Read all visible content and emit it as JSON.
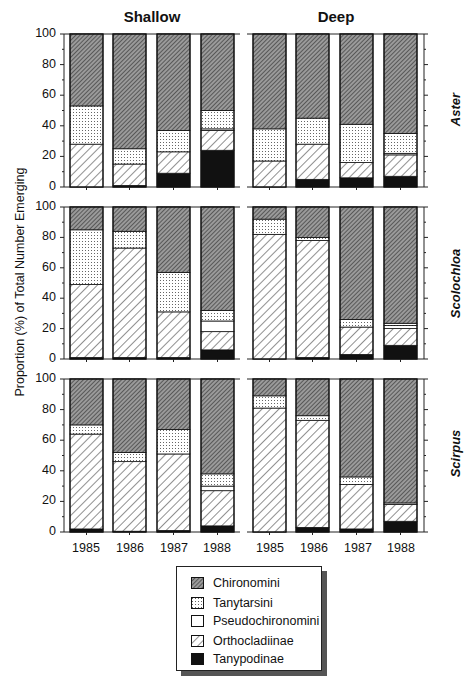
{
  "chart_data": {
    "type": "bar",
    "stacked": true,
    "ylabel": "Proportion (%) of Total Number Emerging",
    "ylim": [
      0,
      100
    ],
    "yticks": [
      0,
      20,
      40,
      60,
      80,
      100
    ],
    "categories": [
      "1985",
      "1986",
      "1987",
      "1988"
    ],
    "columns": [
      "Shallow",
      "Deep"
    ],
    "rows": [
      "Aster",
      "Scolochloa",
      "Scirpus"
    ],
    "series_order_bottom_to_top": [
      "Tanypodinae",
      "Orthocladiinae",
      "Pseudochironomini",
      "Tanytarsini",
      "Chironomini"
    ],
    "legend": [
      "Chironomini",
      "Tanytarsini",
      "Pseudochironomini",
      "Orthocladiinae",
      "Tanypodinae"
    ],
    "panels": [
      {
        "row": "Aster",
        "column": "Shallow",
        "bars": [
          {
            "year": "1985",
            "Tanypodinae": 0,
            "Orthocladiinae": 28,
            "Pseudochironomini": 0,
            "Tanytarsini": 25,
            "Chironomini": 47
          },
          {
            "year": "1986",
            "Tanypodinae": 1,
            "Orthocladiinae": 14,
            "Pseudochironomini": 0,
            "Tanytarsini": 10,
            "Chironomini": 75
          },
          {
            "year": "1987",
            "Tanypodinae": 9,
            "Orthocladiinae": 14,
            "Pseudochironomini": 0,
            "Tanytarsini": 14,
            "Chironomini": 63
          },
          {
            "year": "1988",
            "Tanypodinae": 24,
            "Orthocladiinae": 13,
            "Pseudochironomini": 1,
            "Tanytarsini": 12,
            "Chironomini": 50
          }
        ]
      },
      {
        "row": "Aster",
        "column": "Deep",
        "bars": [
          {
            "year": "1985",
            "Tanypodinae": 0,
            "Orthocladiinae": 17,
            "Pseudochironomini": 0,
            "Tanytarsini": 21,
            "Chironomini": 62
          },
          {
            "year": "1986",
            "Tanypodinae": 5,
            "Orthocladiinae": 23,
            "Pseudochironomini": 0,
            "Tanytarsini": 17,
            "Chironomini": 55
          },
          {
            "year": "1987",
            "Tanypodinae": 6,
            "Orthocladiinae": 10,
            "Pseudochironomini": 0,
            "Tanytarsini": 25,
            "Chironomini": 59
          },
          {
            "year": "1988",
            "Tanypodinae": 7,
            "Orthocladiinae": 14,
            "Pseudochironomini": 1,
            "Tanytarsini": 13,
            "Chironomini": 65
          }
        ]
      },
      {
        "row": "Scolochloa",
        "column": "Shallow",
        "bars": [
          {
            "year": "1985",
            "Tanypodinae": 1,
            "Orthocladiinae": 48,
            "Pseudochironomini": 0,
            "Tanytarsini": 36,
            "Chironomini": 15
          },
          {
            "year": "1986",
            "Tanypodinae": 1,
            "Orthocladiinae": 72,
            "Pseudochironomini": 0,
            "Tanytarsini": 11,
            "Chironomini": 16
          },
          {
            "year": "1987",
            "Tanypodinae": 1,
            "Orthocladiinae": 30,
            "Pseudochironomini": 0,
            "Tanytarsini": 26,
            "Chironomini": 43
          },
          {
            "year": "1988",
            "Tanypodinae": 6,
            "Orthocladiinae": 12,
            "Pseudochironomini": 7,
            "Tanytarsini": 7,
            "Chironomini": 68
          }
        ]
      },
      {
        "row": "Scolochloa",
        "column": "Deep",
        "bars": [
          {
            "year": "1985",
            "Tanypodinae": 0,
            "Orthocladiinae": 82,
            "Pseudochironomini": 0,
            "Tanytarsini": 10,
            "Chironomini": 8
          },
          {
            "year": "1986",
            "Tanypodinae": 1,
            "Orthocladiinae": 77,
            "Pseudochironomini": 0,
            "Tanytarsini": 2,
            "Chironomini": 20
          },
          {
            "year": "1987",
            "Tanypodinae": 3,
            "Orthocladiinae": 18,
            "Pseudochironomini": 0,
            "Tanytarsini": 5,
            "Chironomini": 74
          },
          {
            "year": "1988",
            "Tanypodinae": 9,
            "Orthocladiinae": 11,
            "Pseudochironomini": 2,
            "Tanytarsini": 1.5,
            "Chironomini": 76.5
          }
        ]
      },
      {
        "row": "Scirpus",
        "column": "Shallow",
        "bars": [
          {
            "year": "1985",
            "Tanypodinae": 2,
            "Orthocladiinae": 62,
            "Pseudochironomini": 0,
            "Tanytarsini": 6,
            "Chironomini": 30
          },
          {
            "year": "1986",
            "Tanypodinae": 0.5,
            "Orthocladiinae": 45.5,
            "Pseudochironomini": 0,
            "Tanytarsini": 6,
            "Chironomini": 48
          },
          {
            "year": "1987",
            "Tanypodinae": 1,
            "Orthocladiinae": 50,
            "Pseudochironomini": 0,
            "Tanytarsini": 16,
            "Chironomini": 33
          },
          {
            "year": "1988",
            "Tanypodinae": 4,
            "Orthocladiinae": 23,
            "Pseudochironomini": 3,
            "Tanytarsini": 8,
            "Chironomini": 62
          }
        ]
      },
      {
        "row": "Scirpus",
        "column": "Deep",
        "bars": [
          {
            "year": "1985",
            "Tanypodinae": 0,
            "Orthocladiinae": 81,
            "Pseudochironomini": 0,
            "Tanytarsini": 8,
            "Chironomini": 11
          },
          {
            "year": "1986",
            "Tanypodinae": 3,
            "Orthocladiinae": 70,
            "Pseudochironomini": 0,
            "Tanytarsini": 3,
            "Chironomini": 24
          },
          {
            "year": "1987",
            "Tanypodinae": 2,
            "Orthocladiinae": 29,
            "Pseudochironomini": 0,
            "Tanytarsini": 5,
            "Chironomini": 64
          },
          {
            "year": "1988",
            "Tanypodinae": 7,
            "Orthocladiinae": 11,
            "Pseudochironomini": 0,
            "Tanytarsini": 1,
            "Chironomini": 81
          }
        ]
      }
    ],
    "grid": false,
    "legend_position": "bottom-center"
  },
  "labels": {
    "col_shallow": "Shallow",
    "col_deep": "Deep",
    "row_aster": "Aster",
    "row_scolochloa": "Scolochloa",
    "row_scirpus": "Scirpus",
    "y_axis": "Proportion (%) of Total Number Emerging",
    "years": [
      "1985",
      "1986",
      "1987",
      "1988"
    ],
    "yticks": [
      "100",
      "80",
      "60",
      "40",
      "20",
      "0"
    ],
    "legend": [
      "Chironomini",
      "Tanytarsini",
      "Pseudochironomini",
      "Orthocladiinae",
      "Tanypodinae"
    ]
  },
  "colors": {
    "ink": "#111111",
    "Chironomini_bg": "#8a8a8a",
    "Tanytarsini_dot": "#555555",
    "Tanypodinae": "#111111",
    "background": "#ffffff"
  }
}
